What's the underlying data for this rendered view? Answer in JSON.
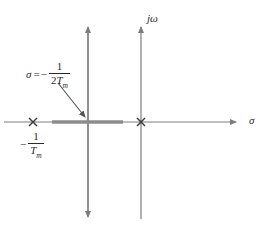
{
  "figure": {
    "width": 269,
    "height": 235,
    "background_color": "#ffffff"
  },
  "colors": {
    "axis": "#7c7c7c",
    "locus": "#8c8c8c",
    "pole_mark": "#3a3a3a",
    "text": "#2b2b2b",
    "leader": "#555555"
  },
  "axes": {
    "real": {
      "name": "sigma",
      "label": "σ",
      "y": 122,
      "x_start": 4,
      "x_end": 243,
      "arrow": "right"
    },
    "imaginary": {
      "name": "j-omega",
      "label_j": "j",
      "label_omega": "ω",
      "x": 141,
      "y_top": 22,
      "y_bottom": 219,
      "arrow": "up"
    },
    "vertical_marker_line": {
      "name": "sigma-constant-line",
      "x": 88,
      "y_top": 22,
      "y_bottom": 222,
      "arrow": "both"
    }
  },
  "locus": {
    "name": "real-axis-locus-segment",
    "x_start": 52,
    "x_end": 123,
    "y": 122,
    "thickness": 3
  },
  "poles": [
    {
      "name": "pole-left",
      "glyph": "×",
      "x": 33,
      "y": 122,
      "label_text": "-1/Tm"
    },
    {
      "name": "pole-origin-region",
      "glyph": "×",
      "x": 141,
      "y": 122,
      "label_text": ""
    }
  ],
  "labels": {
    "sigma_value": {
      "symbol": "σ",
      "equals": "=",
      "minus": "−",
      "numerator": "1",
      "denominator_lead": "2",
      "denominator_var": "T",
      "denominator_sub": "m",
      "full_text": "σ = − 1/(2Tₘ)"
    },
    "pole_value": {
      "minus": "−",
      "numerator": "1",
      "denominator_var": "T",
      "denominator_sub": "m",
      "full_text": "− 1/Tₘ"
    },
    "j_omega": {
      "j": "j",
      "omega": "ω",
      "full_text": "jω"
    },
    "sigma_axis": {
      "full_text": "σ"
    }
  },
  "leader_arrow": {
    "name": "leader-line-sigma-label",
    "from_x": 58,
    "from_y": 83,
    "to_x": 87,
    "to_y": 119
  }
}
